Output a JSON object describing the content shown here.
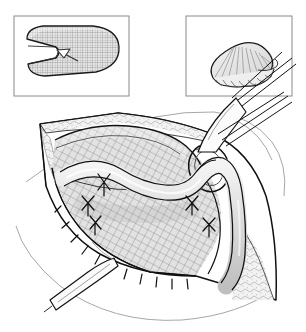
{
  "figure": {
    "title": "Inguinal hernia mesh repair operative illustration",
    "style": "black-and-white medical line drawing with stipple and crosshatch shading",
    "background_color": "#ffffff",
    "line_color": "#1a1a1a",
    "mesh_tone": "#dcdcdc",
    "tissue_tone": "#e8e8e8",
    "cord_tone": "#d8d8d8",
    "panel_border_color": "#8a8a8a",
    "width": 306,
    "height": 332
  },
  "insets": [
    {
      "name": "flat-mesh-panel",
      "label": "",
      "position": "top-left",
      "contents": "Flat oval prosthetic mesh patch with crosshatched weave texture and a lateral slit opening; an arrowhead marks the slit through which the spermatic cord is passed.",
      "elements": [
        "mesh-patch-outline",
        "mesh-weave-texture",
        "mesh-slit",
        "slit-arrow-marker"
      ]
    },
    {
      "name": "rolled-plug-panel",
      "label": "",
      "position": "top-right",
      "contents": "Mesh rolled into a conical plug with radiating pleat folds and a fluted skirt edge.",
      "elements": [
        "plug-cone-outline",
        "plug-radiating-pleats",
        "plug-fluted-skirt"
      ]
    }
  ],
  "main_view": {
    "name": "operative-field",
    "description": "Open inguinal incision held by retractors, exposing the posterior wall with prosthetic mesh sutured in place and the spermatic cord emerging through a mesh keyhole ring.",
    "structures": [
      {
        "name": "incision-wound-edge",
        "note": "Diamond-shaped opened wound margin outlined in ink"
      },
      {
        "name": "subcutaneous-fat-tissue",
        "note": "Lobulated fatty tissue along the upper-left and right wound edges"
      },
      {
        "name": "prosthetic-mesh",
        "note": "Large crosshatched mesh sheet covering the inguinal floor"
      },
      {
        "name": "mesh-keyhole-ring",
        "note": "Ring of mesh encircling the cord at the internal ring"
      },
      {
        "name": "spermatic-cord",
        "note": "Pale tubular cord crossing the field and passing through the mesh ring"
      },
      {
        "name": "interrupted-x-sutures",
        "note": "Five X-shaped interrupted stitches anchoring the mesh"
      },
      {
        "name": "running-suture-line",
        "note": "Continuous suture along the inferior mesh border at the inguinal ligament"
      },
      {
        "name": "retractor-upper-right",
        "note": "Narrow retractor blade entering from upper right"
      },
      {
        "name": "retractor-lower-left",
        "note": "Narrow retractor blade entering from lower left"
      }
    ],
    "suture_counts": {
      "interrupted_x_sutures": 5,
      "running_stitches": 11
    }
  }
}
